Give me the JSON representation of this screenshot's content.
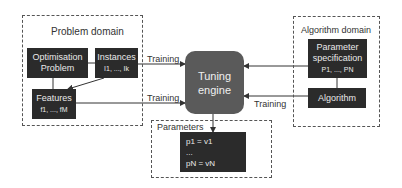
{
  "problem_domain": {
    "title": "Problem domain",
    "optimisation_problem": [
      "Optimisation",
      "Problem"
    ],
    "instances": {
      "label": "Instances",
      "range": "I1, ..., Ik"
    },
    "features": {
      "label": "Features",
      "range": "f1, ..., fM"
    }
  },
  "algorithm_domain": {
    "title": "Algorithm domain",
    "parameter_specification": {
      "lines": [
        "Parameter",
        "specification"
      ],
      "range": "P1, ..., PN"
    },
    "algorithm": "Algorithm"
  },
  "tuning_engine": [
    "Tuning",
    "engine"
  ],
  "parameters": {
    "title": "Parameters",
    "first": "p1 = v1",
    "ellipsis": "...",
    "last": "pN = vN"
  },
  "edges": {
    "training_top": "Training",
    "training_bottom": "Training",
    "training_right": "Training"
  }
}
